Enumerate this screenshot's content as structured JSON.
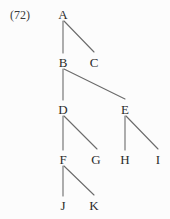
{
  "figure": {
    "example_number": "(72)",
    "example_number_x": 10,
    "example_number_y": 9,
    "width": 170,
    "height": 219,
    "background_color": "#fcfcfc",
    "edge_color": "#6b6b6b",
    "text_color": "#2b2b2b",
    "edge_width": 1.1
  },
  "tree": {
    "type": "tree-diagram",
    "root": "A",
    "nodes": [
      {
        "id": "A",
        "label": "A",
        "x": 63,
        "y": 8,
        "depth": 0
      },
      {
        "id": "B",
        "label": "B",
        "x": 63,
        "y": 56,
        "depth": 1
      },
      {
        "id": "C",
        "label": "C",
        "x": 94,
        "y": 56,
        "depth": 1
      },
      {
        "id": "D",
        "label": "D",
        "x": 63,
        "y": 103,
        "depth": 2
      },
      {
        "id": "E",
        "label": "E",
        "x": 125,
        "y": 103,
        "depth": 2
      },
      {
        "id": "F",
        "label": "F",
        "x": 63,
        "y": 153,
        "depth": 3
      },
      {
        "id": "G",
        "label": "G",
        "x": 96,
        "y": 153,
        "depth": 3
      },
      {
        "id": "H",
        "label": "H",
        "x": 125,
        "y": 153,
        "depth": 3
      },
      {
        "id": "I",
        "label": "I",
        "x": 158,
        "y": 153,
        "depth": 3
      },
      {
        "id": "J",
        "label": "J",
        "x": 63,
        "y": 199,
        "depth": 4
      },
      {
        "id": "K",
        "label": "K",
        "x": 94,
        "y": 199,
        "depth": 4
      }
    ],
    "edges": [
      {
        "from": "A",
        "to": "B",
        "x1": 63,
        "y1": 21,
        "x2": 63,
        "y2": 53
      },
      {
        "from": "A",
        "to": "C",
        "x1": 64,
        "y1": 21,
        "x2": 94,
        "y2": 52
      },
      {
        "from": "B",
        "to": "D",
        "x1": 63,
        "y1": 69,
        "x2": 63,
        "y2": 100
      },
      {
        "from": "B",
        "to": "E",
        "x1": 64,
        "y1": 69,
        "x2": 125,
        "y2": 99
      },
      {
        "from": "D",
        "to": "F",
        "x1": 63,
        "y1": 116,
        "x2": 63,
        "y2": 150
      },
      {
        "from": "D",
        "to": "G",
        "x1": 64,
        "y1": 116,
        "x2": 97,
        "y2": 149
      },
      {
        "from": "E",
        "to": "H",
        "x1": 125,
        "y1": 116,
        "x2": 125,
        "y2": 150
      },
      {
        "from": "E",
        "to": "I",
        "x1": 126,
        "y1": 116,
        "x2": 158,
        "y2": 149
      },
      {
        "from": "F",
        "to": "J",
        "x1": 63,
        "y1": 166,
        "x2": 63,
        "y2": 196
      },
      {
        "from": "F",
        "to": "K",
        "x1": 64,
        "y1": 166,
        "x2": 94,
        "y2": 195
      }
    ]
  }
}
